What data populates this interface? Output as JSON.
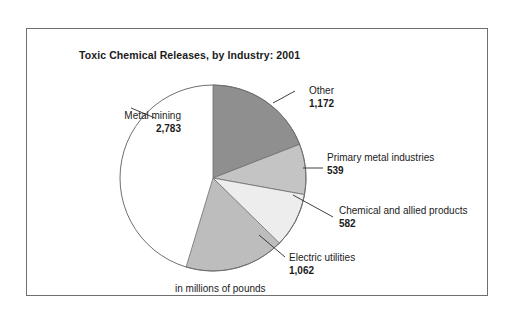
{
  "figure": {
    "title": "Toxic Chemical Releases, by Industry: 2001",
    "footnote": "in millions of pounds",
    "frame_color": "#6f6f6f",
    "background": "#ffffff"
  },
  "chart_data": {
    "type": "pie",
    "title": "Toxic Chemical Releases, by Industry: 2001",
    "units": "in millions of pounds",
    "xlabel": "",
    "ylabel": "",
    "legend_position": "callout-labels",
    "grid": false,
    "total": 6138,
    "categories": [
      "Metal mining",
      "Other",
      "Primary metal industries",
      "Chemical and allied products",
      "Electric utilities"
    ],
    "values": [
      2783,
      1172,
      539,
      582,
      1062
    ],
    "value_labels": [
      "2,783",
      "1,172",
      "539",
      "582",
      "1,062"
    ],
    "colors": [
      "#9a9a9a",
      "#8f8f8f",
      "#c4c4c4",
      "#ededed",
      "#bdbdbd"
    ],
    "slices": [
      {
        "name": "Metal mining",
        "value": 2783,
        "value_label": "2,783",
        "color": "#9a9a9a",
        "start_angle": 196.8,
        "end_angle": 360.0,
        "percent": 45.3
      },
      {
        "name": "Other",
        "value": 1172,
        "value_label": "1,172",
        "color": "#8f8f8f",
        "start_angle": 0.0,
        "end_angle": 68.7,
        "percent": 19.1
      },
      {
        "name": "Primary metal industries",
        "value": 539,
        "value_label": "539",
        "color": "#c4c4c4",
        "start_angle": 68.7,
        "end_angle": 100.3,
        "percent": 8.8
      },
      {
        "name": "Chemical and allied products",
        "value": 582,
        "value_label": "582",
        "color": "#ededed",
        "start_angle": 100.3,
        "end_angle": 134.4,
        "percent": 9.5
      },
      {
        "name": "Electric utilities",
        "value": 1062,
        "value_label": "1,062",
        "color": "#bdbdbd",
        "start_angle": 134.4,
        "end_angle": 196.8,
        "percent": 17.3
      }
    ]
  },
  "labels": {
    "metal_mining": {
      "name": "Metal mining",
      "value": "2,783"
    },
    "other": {
      "name": "Other",
      "value": "1,172"
    },
    "primary_metal": {
      "name": "Primary metal industries",
      "value": "539"
    },
    "chemical": {
      "name": "Chemical and allied products",
      "value": "582"
    },
    "electric": {
      "name": "Electric utilities",
      "value": "1,062"
    }
  }
}
